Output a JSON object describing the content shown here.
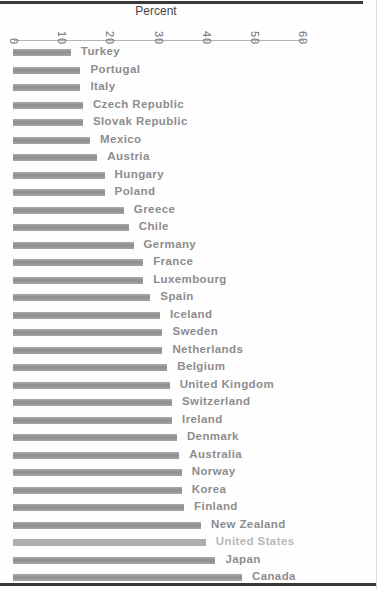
{
  "figure": {
    "axis_title": "Percent"
  },
  "chart_data": {
    "type": "bar",
    "orientation": "horizontal",
    "title": "",
    "xlabel": "Percent",
    "ylabel": "",
    "xlim": [
      0,
      60
    ],
    "axis_ticks": [
      0,
      10,
      20,
      30,
      40,
      50,
      60
    ],
    "grid": false,
    "legend": false,
    "categories": [
      "Turkey",
      "Portugal",
      "Italy",
      "Czech Republic",
      "Slovak Republic",
      "Mexico",
      "Austria",
      "Hungary",
      "Poland",
      "Greece",
      "Chile",
      "Germany",
      "France",
      "Luxembourg",
      "Spain",
      "Iceland",
      "Sweden",
      "Netherlands",
      "Belgium",
      "United Kingdom",
      "Switzerland",
      "Ireland",
      "Denmark",
      "Australia",
      "Norway",
      "Korea",
      "Finland",
      "New Zealand",
      "United States",
      "Japan",
      "Canada"
    ],
    "values": [
      12,
      14,
      14,
      14.5,
      14.5,
      16,
      17.5,
      19,
      19,
      23,
      24,
      25,
      27,
      27,
      28.5,
      30.5,
      31,
      31,
      32,
      32.5,
      33,
      33,
      34,
      34.5,
      35,
      35,
      35.5,
      39,
      40,
      42,
      47.5
    ],
    "highlighted_category": "United States",
    "colors": {
      "bar": "#9a9a9a",
      "bar_highlight": "#aeaeae",
      "label": "#8d8d8d",
      "label_highlight": "#b8b8b8",
      "axis": "#b3b3b3",
      "tick_text": "#6d6d6d",
      "rule": "#3a3a3a"
    }
  }
}
